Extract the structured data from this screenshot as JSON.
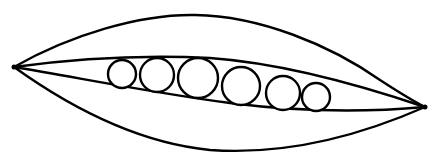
{
  "image": {
    "subject": "pea pod line drawing",
    "description": "Open pea pod containing six peas",
    "colors": {
      "background": "#ffffff",
      "stroke": "#000000"
    },
    "pea_count": 6
  },
  "pod": {
    "left_tip": [
      14,
      67
    ],
    "right_tip": [
      425,
      107
    ]
  },
  "peas": [
    {
      "cx": 122,
      "cy": 74,
      "r": 14
    },
    {
      "cx": 157,
      "cy": 75,
      "r": 17
    },
    {
      "cx": 198,
      "cy": 78,
      "r": 20
    },
    {
      "cx": 241,
      "cy": 86,
      "r": 19
    },
    {
      "cx": 283,
      "cy": 93,
      "r": 17
    },
    {
      "cx": 316,
      "cy": 97,
      "r": 14
    }
  ]
}
